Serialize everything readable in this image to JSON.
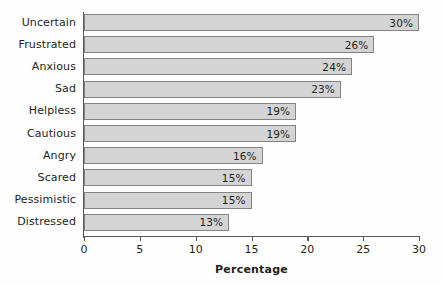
{
  "chart_data": {
    "type": "bar",
    "orientation": "horizontal",
    "title": "",
    "xlabel": "Percentage",
    "ylabel": "",
    "xlim": [
      0,
      30
    ],
    "xticks": [
      "0",
      "5",
      "10",
      "15",
      "20",
      "25",
      "30"
    ],
    "grid": false,
    "legend": null,
    "categories": [
      "Uncertain",
      "Frustrated",
      "Anxious",
      "Sad",
      "Helpless",
      "Cautious",
      "Angry",
      "Scared",
      "Pessimistic",
      "Distressed"
    ],
    "values": [
      30,
      26,
      24,
      23,
      19,
      19,
      16,
      15,
      15,
      13
    ],
    "data_labels": [
      "30%",
      "26%",
      "24%",
      "23%",
      "19%",
      "19%",
      "16%",
      "15%",
      "15%",
      "13%"
    ],
    "colors": {
      "bar_fill": "#d4d4d4",
      "bar_border": "#848484",
      "axis": "#58585a",
      "text": "#231f20",
      "background": "#fefefe"
    }
  }
}
